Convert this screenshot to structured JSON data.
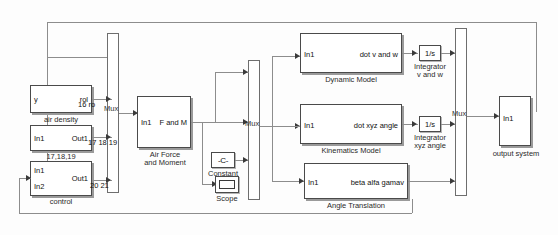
{
  "diagram": {
    "background_color": "#fdfdfd",
    "wire_color": "#8d8d8d",
    "block_border_color": "#4a4a4a",
    "shadow_color": "#9a9a9a"
  },
  "blocks": {
    "air_density": {
      "caption": "air density",
      "in1": "y",
      "out1": "rol"
    },
    "subsystem_171819": {
      "caption": "17,18,19",
      "in1": "In1",
      "out1": "Out1"
    },
    "control": {
      "caption": "control",
      "in1": "In1",
      "in2": "In2",
      "out1": "Out1"
    },
    "mux_left": {
      "label": "Mux"
    },
    "air_force_and_moment": {
      "caption_line1": "Air Force",
      "caption_line2": "and Moment",
      "in1": "In1",
      "out1": "F and M"
    },
    "constant": {
      "caption": "Constant",
      "glyph": "-C-"
    },
    "scope": {
      "caption": "Scope",
      "glyph": "scope-icon"
    },
    "mux_mid": {
      "label": "Mux"
    },
    "dynamic_model": {
      "caption": "Dynamic Model",
      "in1": "In1",
      "out1": "dot v and w"
    },
    "integrator_vw": {
      "glyph": "1/s",
      "caption_line1": "Integrator",
      "caption_line2": "v and w"
    },
    "kinematics_model": {
      "caption": "Kinematics Model",
      "in1": "In1",
      "out1": "dot xyz angle"
    },
    "integrator_xyz": {
      "glyph": "1/s",
      "caption_line1": "Integrator",
      "caption_line2": "xyz angle"
    },
    "angle_translation": {
      "caption": "Angle Translation",
      "in1": "In1",
      "out1": "beta alfa gamav"
    },
    "mux_right": {
      "label": "Mux"
    },
    "output_system": {
      "caption": "output system",
      "in1": "In1"
    }
  },
  "signals": {
    "s16": "16 ro",
    "s171819": "17 18 19",
    "s2021": "20 21"
  }
}
